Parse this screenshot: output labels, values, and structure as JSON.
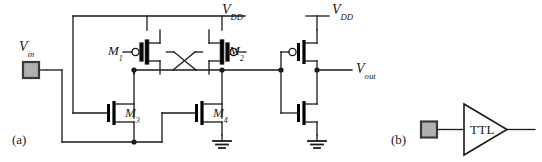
{
  "figure": {
    "type": "circuit-schematic",
    "panels": [
      {
        "id": "a",
        "label": "(a)"
      },
      {
        "id": "b",
        "label": "(b)"
      }
    ]
  },
  "colors": {
    "wire": "#1a1a1a",
    "device": "#000000",
    "pad_fill": "#b0b0b0",
    "pad_border": "#3a3a3a",
    "background": "#ffffff",
    "text": "#1a1a1a"
  },
  "panel_a": {
    "label": "(a)",
    "signals": {
      "input": {
        "base": "V",
        "sub": "in",
        "name": "Vin"
      },
      "supply_left": {
        "base": "V",
        "sub": "DD",
        "name": "VDD"
      },
      "supply_right": {
        "base": "V",
        "sub": "DD",
        "name": "VDD"
      },
      "output": {
        "base": "V",
        "sub": "out",
        "name": "Vout"
      }
    },
    "transistors": [
      {
        "id": "M1",
        "label": "M",
        "sub": "1",
        "type": "pmos",
        "note": "cross-coupled load, gate to right node"
      },
      {
        "id": "M2",
        "label": "M",
        "sub": "2",
        "type": "pmos",
        "note": "cross-coupled load, gate to left node"
      },
      {
        "id": "M3",
        "label": "M",
        "sub": "3",
        "type": "nmos",
        "note": "input driver, gate from Vin branch"
      },
      {
        "id": "M4",
        "label": "M",
        "sub": "4",
        "type": "nmos",
        "note": "driver, gate from bottom rail"
      },
      {
        "id": "MP_out",
        "label": "",
        "sub": "",
        "type": "pmos",
        "note": "output inverter pull-up"
      },
      {
        "id": "MN_out",
        "label": "",
        "sub": "",
        "type": "nmos",
        "note": "output inverter pull-down"
      }
    ],
    "pad": {
      "name": "input-pad",
      "shape": "square"
    },
    "ground_symbols": 2
  },
  "panel_b": {
    "label": "(b)",
    "buffer": {
      "text": "TTL",
      "shape": "triangle"
    },
    "pad": {
      "name": "input-pad",
      "shape": "square"
    }
  }
}
